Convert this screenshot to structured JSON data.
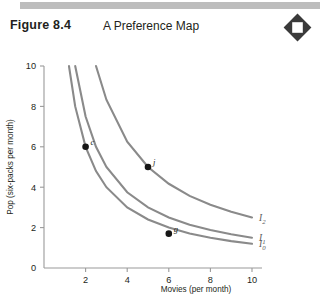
{
  "header": {
    "figure_number": "Figure 8.4",
    "figure_title": "A Preference Map",
    "icon": "diamond-square-icon"
  },
  "chart_data": {
    "type": "line",
    "title": "A Preference Map",
    "xlabel": "Movies (per month)",
    "ylabel": "Pop (six-packs per month)",
    "xlim": [
      0,
      10.6
    ],
    "ylim": [
      0,
      10.6
    ],
    "xticks": [
      "2",
      "4",
      "6",
      "8",
      "10"
    ],
    "xtick_values": [
      2,
      4,
      6,
      8,
      10
    ],
    "yticks": [
      "0",
      "2",
      "4",
      "6",
      "8",
      "10"
    ],
    "ytick_values": [
      0,
      2,
      4,
      6,
      8,
      10
    ],
    "grid": false,
    "legend": "inline-right",
    "series": [
      {
        "name": "I0",
        "label": "I",
        "sub": "0",
        "curve_constant": 12,
        "x": [
          1.2,
          1.5,
          2,
          2.5,
          3,
          4,
          5,
          6,
          7,
          8,
          9,
          10
        ],
        "y": [
          10,
          8.0,
          6.0,
          4.8,
          4.0,
          3.0,
          2.4,
          2.0,
          1.71,
          1.5,
          1.33,
          1.2
        ]
      },
      {
        "name": "I1",
        "label": "I",
        "sub": "1",
        "curve_constant": 15,
        "x": [
          1.5,
          2,
          2.5,
          3,
          4,
          5,
          6,
          7,
          8,
          9,
          10
        ],
        "y": [
          10,
          7.5,
          6.0,
          5.0,
          3.75,
          3.0,
          2.5,
          2.14,
          1.88,
          1.67,
          1.5
        ]
      },
      {
        "name": "I2",
        "label": "I",
        "sub": "2",
        "curve_constant": 25,
        "x": [
          2.5,
          3,
          4,
          5,
          6,
          7,
          8,
          9,
          10
        ],
        "y": [
          10,
          8.33,
          6.25,
          5.0,
          4.17,
          3.57,
          3.13,
          2.78,
          2.5
        ]
      }
    ],
    "points": [
      {
        "label": "c",
        "x": 2,
        "y": 6,
        "on_series": "I1"
      },
      {
        "label": "j",
        "x": 5,
        "y": 5,
        "on_series": "I2"
      },
      {
        "label": "g",
        "x": 6,
        "y": 1.7,
        "on_series": "I0"
      }
    ],
    "colors": {
      "curve": "#8a8a8a",
      "axis": "#9a9a9a",
      "point": "#161616",
      "text": "#231f20",
      "topbar": "#bdbdbd",
      "icon": "#3a3a3a"
    }
  }
}
